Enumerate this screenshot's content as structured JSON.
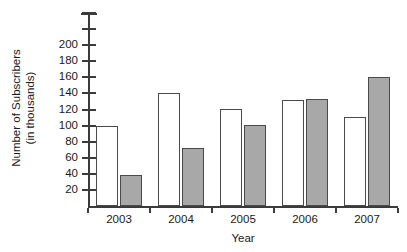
{
  "chart_data": {
    "type": "bar",
    "title": "",
    "xlabel": "Year",
    "ylabel": "Number of Subscribers (in thousands)",
    "ylabel_lines": [
      "Number of Subscribers",
      "(in thousands)"
    ],
    "categories": [
      "2003",
      "2004",
      "2005",
      "2006",
      "2007"
    ],
    "series": [
      {
        "name": "series-1-open",
        "fill": "#ffffff",
        "values": [
          100,
          140,
          121,
          132,
          111
        ]
      },
      {
        "name": "series-2-solid",
        "fill": "#a8a8a8",
        "values": [
          38,
          72,
          101,
          133,
          160
        ]
      }
    ],
    "ylim": [
      0,
      240
    ],
    "ytick_labels": [
      "200",
      "180",
      "160",
      "140",
      "120",
      "100",
      "80",
      "60",
      "40",
      "20"
    ],
    "ytick_values": [
      200,
      180,
      160,
      140,
      120,
      100,
      80,
      60,
      40,
      20
    ],
    "unlabeled_ytick_values": [
      240,
      220
    ],
    "ytick_step": 20,
    "grid": false,
    "legend": false,
    "axis_color": "#3b3b3b",
    "bar_outline_color": "#4a4a4a"
  }
}
